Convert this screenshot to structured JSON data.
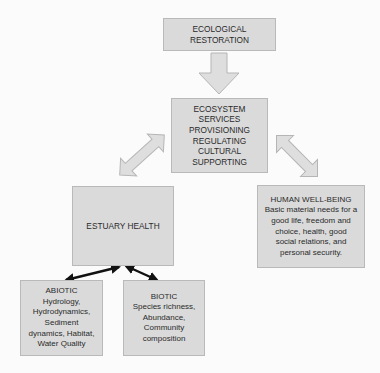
{
  "nodes": {
    "restoration": {
      "lines": [
        "ECOLOGICAL",
        "RESTORATION"
      ]
    },
    "services": {
      "lines": [
        "ECOSYSTEM",
        "SERVICES",
        "PROVISIONING",
        "REGULATING",
        "CULTURAL",
        "SUPPORTING"
      ]
    },
    "estuary": {
      "lines": [
        "ESTUARY HEALTH"
      ]
    },
    "wellbeing": {
      "lines": [
        "HUMAN WELL-BEING",
        "Basic material needs for a",
        "good life, freedom and",
        "choice, health, good",
        "social relations, and",
        "personal security."
      ]
    },
    "abiotic": {
      "lines": [
        "ABIOTIC",
        "Hydrology,",
        "Hydrodynamics,",
        "Sediment",
        "dynamics, Habitat,",
        "Water Quality"
      ]
    },
    "biotic": {
      "lines": [
        "BIOTIC",
        "Species richness,",
        "Abundance,",
        "Community",
        "composition"
      ]
    }
  },
  "edges": [
    {
      "from": "restoration",
      "to": "services",
      "style": "block-arrow-down"
    },
    {
      "from": "services",
      "to": "estuary",
      "style": "block-double-arrow"
    },
    {
      "from": "services",
      "to": "wellbeing",
      "style": "block-double-arrow"
    },
    {
      "from": "estuary",
      "to": "abiotic",
      "style": "black-double-arrow"
    },
    {
      "from": "estuary",
      "to": "biotic",
      "style": "black-double-arrow"
    }
  ],
  "colors": {
    "box_fill": "#dadada",
    "box_border": "#b9b9b9",
    "block_arrow_fill": "#dedede",
    "block_arrow_stroke": "#b5b5b5",
    "line_arrow": "#111111"
  }
}
